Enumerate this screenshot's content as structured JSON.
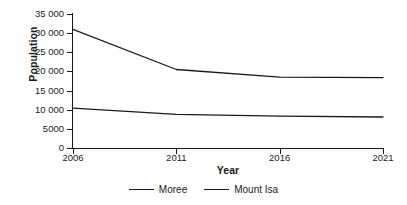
{
  "chart_data": {
    "type": "line",
    "title": "",
    "xlabel": "Year",
    "ylabel": "Population",
    "categories": [
      "2006",
      "2011",
      "2016",
      "2021"
    ],
    "x": [
      2006,
      2011,
      2016,
      2021
    ],
    "xlim": [
      2006,
      2021
    ],
    "ylim": [
      0,
      35000
    ],
    "grid": false,
    "legend_position": "bottom",
    "ytick_labels": [
      "35 000",
      "30 000",
      "25 000",
      "20 000",
      "15 000",
      "10 000",
      "5000",
      "0"
    ],
    "ytick_values": [
      35000,
      30000,
      25000,
      20000,
      15000,
      10000,
      5000,
      0
    ],
    "series": [
      {
        "name": "Moree",
        "values": [
          10400,
          8800,
          8300,
          8100
        ],
        "color": "#1a1a1a"
      },
      {
        "name": "Mount Isa",
        "values": [
          31000,
          20500,
          18500,
          18400
        ],
        "color": "#1a1a1a"
      }
    ]
  },
  "legend": {
    "items": [
      {
        "label": "Moree"
      },
      {
        "label": "Mount Isa"
      }
    ]
  },
  "colors": {
    "ink": "#1a1a1a",
    "background": "#ffffff"
  }
}
